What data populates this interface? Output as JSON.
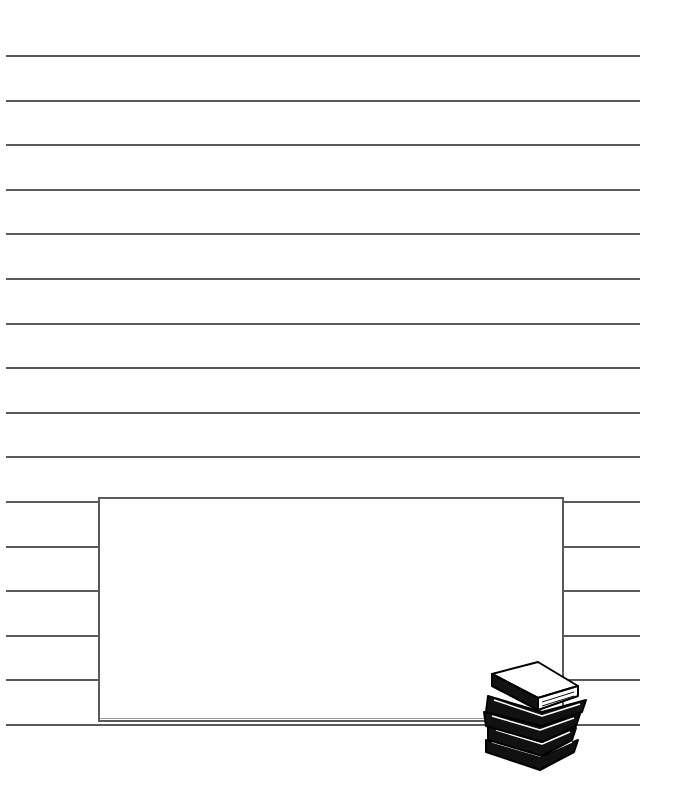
{
  "page": {
    "type": "lined writing paper",
    "background": "#ffffff",
    "line_color": "#5a5a5a"
  },
  "lines": {
    "count": 16,
    "left": 6,
    "right": 640,
    "first_y": 55,
    "spacing": 44.6
  },
  "writing_box": {
    "left": 98,
    "top": 497,
    "width": 466,
    "height": 225,
    "text": ""
  },
  "decoration": {
    "icon": "stack-of-books-icon"
  }
}
